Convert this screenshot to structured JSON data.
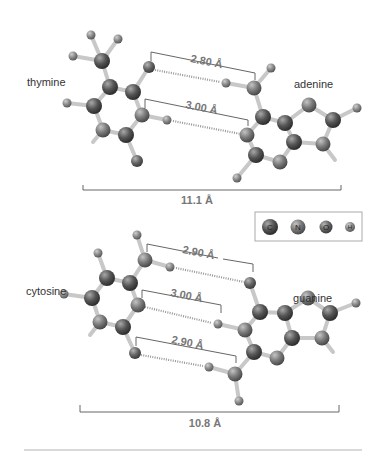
{
  "diagram": {
    "colors": {
      "background": "#ffffff",
      "bond": "#c8c8c8",
      "bracket": "#666666",
      "hbond": "#999999",
      "atom_C": "#5a5a5a",
      "atom_N": "#7a7a7a",
      "atom_O": "#6a6a6a",
      "atom_H": "#8a8a8a",
      "divider": "#cccccc"
    },
    "legend": {
      "items": [
        {
          "symbol": "C",
          "label": "C"
        },
        {
          "symbol": "N",
          "label": "N"
        },
        {
          "symbol": "O",
          "label": "O"
        },
        {
          "symbol": "H",
          "label": "H"
        }
      ]
    },
    "pairs": [
      {
        "left_base": "thymine",
        "right_base": "adenine",
        "hbonds": [
          "2.80 Å",
          "3.00 Å"
        ],
        "total_width": "11.1 Å"
      },
      {
        "left_base": "cytosine",
        "right_base": "guanine",
        "hbonds": [
          "2.90 Å",
          "3.00 Å",
          "2.90 Å"
        ],
        "total_width": "10.8 Å"
      }
    ]
  }
}
